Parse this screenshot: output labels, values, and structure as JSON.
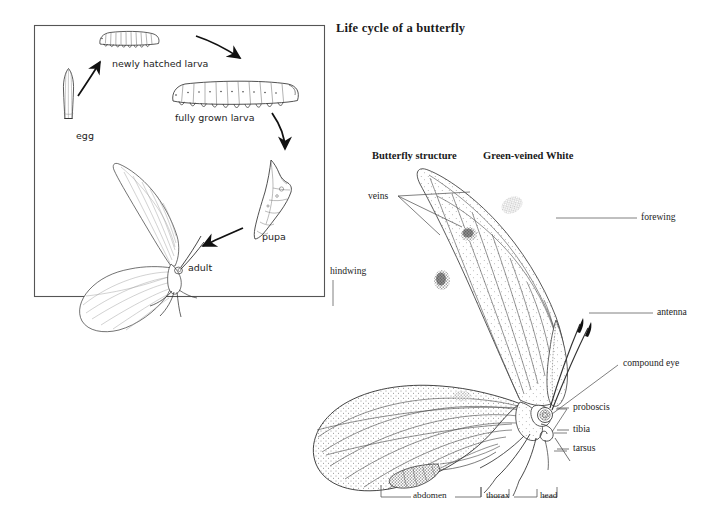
{
  "figure": {
    "title": "Life cycle of a butterfly",
    "background_color": "#ffffff",
    "ink_color": "#1a1a1a"
  },
  "life_cycle": {
    "panel_border_color": "#555555",
    "stages": [
      {
        "key": "egg",
        "label": "egg"
      },
      {
        "key": "newly-hatched-larva",
        "label": "newly hatched larva"
      },
      {
        "key": "fully-grown-larva",
        "label": "fully grown larva"
      },
      {
        "key": "pupa",
        "label": "pupa"
      },
      {
        "key": "adult",
        "label": "adult"
      }
    ]
  },
  "structure": {
    "heading_left": "Butterfly structure",
    "heading_right": "Green-veined White",
    "parts": [
      {
        "key": "veins",
        "label": "veins"
      },
      {
        "key": "hindwing",
        "label": "hindwing"
      },
      {
        "key": "forewing",
        "label": "forewing"
      },
      {
        "key": "antenna",
        "label": "antenna"
      },
      {
        "key": "compound-eye",
        "label": "compound eye"
      },
      {
        "key": "proboscis",
        "label": "proboscis"
      },
      {
        "key": "tibia",
        "label": "tibia"
      },
      {
        "key": "tarsus",
        "label": "tarsus"
      }
    ],
    "body_regions": [
      {
        "key": "abdomen",
        "label": "abdomen"
      },
      {
        "key": "thorax",
        "label": "thorax"
      },
      {
        "key": "head",
        "label": "head"
      }
    ]
  }
}
